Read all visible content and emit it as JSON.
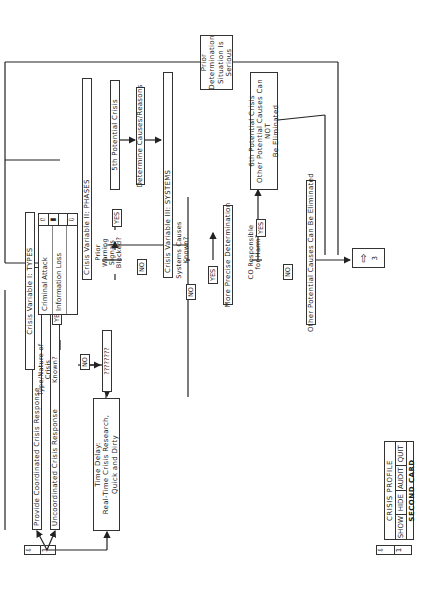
{
  "diagram": {
    "nav_start": {
      "arrow": "⇩",
      "number": "1"
    },
    "responses": {
      "coordinated": "Provide Coordinated Crisis Response",
      "uncoordinated": "Uncoordinated Crisis Response"
    },
    "time_delay": {
      "line1": "Time Delay:",
      "line2": "Real-Time Crisis Research,",
      "line3": "Quick and Dirty"
    },
    "decision_type": {
      "line1": "Type/Nature of",
      "line2": "Crisis",
      "line3": "Known?"
    },
    "unknown_type": "????????",
    "variable_types": "Crisis Variable I: TYPES",
    "types_list": [
      "Criminal Attack",
      "Information Loss",
      ""
    ],
    "scroll": {
      "up": "⇧",
      "thumb": "▮",
      "down": "⇩"
    },
    "variable_phases": "Crisis Variable II: PHASES",
    "decision_warning": {
      "line1": "Prior Warning",
      "line2": "Signals",
      "line3": "Blocked?"
    },
    "fifth_crisis": "5th Potential Crisis",
    "determine_causes": "Determine Causes/Reasons",
    "variable_systems": "Crisis Variable III: SYSTEMS",
    "decision_systems": {
      "line1": "Systems Causes",
      "line2": "Known?"
    },
    "more_precise": "More Precise Determination",
    "decision_co": {
      "line1": "CO Responsible",
      "line2": "for Harm?"
    },
    "sixth_crisis": {
      "line1": "6th Potential Crisis",
      "line2": "Other Potential Causes Can NOT",
      "line3": "Be Eliminated"
    },
    "eliminated": "Other Potential Causes Can Be Eliminated",
    "prior_determination": {
      "line1": "Prior",
      "line2": "Determination",
      "line3": "Situation Is",
      "line4": "Serious"
    },
    "next": {
      "arrow": "⇨",
      "number": "3"
    },
    "labels": {
      "yes": "YES",
      "no": "NO"
    }
  },
  "card": {
    "title": "CRISIS PROFILE",
    "buttons": [
      "SHOW",
      "HIDE",
      "AUDIT",
      "QUIT"
    ],
    "subtitle": "SECOND CARD",
    "nav": {
      "arrow": "⇩",
      "number": "1"
    }
  }
}
